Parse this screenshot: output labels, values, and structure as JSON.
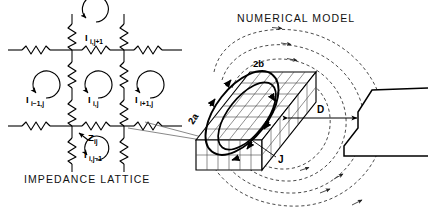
{
  "figure": {
    "background_color": "#ffffff",
    "ink_color": "#000000",
    "dash_color": "#333333",
    "panels": [
      {
        "id": "impedance-lattice",
        "caption": "IMPEDANCE LATTICE"
      },
      {
        "id": "numerical-model",
        "caption": "NUMERICAL MODEL"
      }
    ]
  },
  "lattice": {
    "caption": "IMPEDANCE LATTICE",
    "impedance_label": "Z",
    "impedance_sub": "ij",
    "loops": [
      {
        "name": "loop-up",
        "base": "I",
        "sub": "i,j+1",
        "direction": "clockwise"
      },
      {
        "name": "loop-left",
        "base": "I",
        "sub": "i−1,j",
        "direction": "clockwise"
      },
      {
        "name": "loop-center",
        "base": "I",
        "sub": "i,j",
        "direction": "clockwise"
      },
      {
        "name": "loop-right",
        "base": "I",
        "sub": "i+1,j",
        "direction": "clockwise"
      },
      {
        "name": "loop-down",
        "base": "I",
        "sub": "i,j−1",
        "direction": "clockwise"
      }
    ],
    "element_type": "resistor-zigzag",
    "grid_columns": 2,
    "grid_rows": 3
  },
  "model": {
    "caption": "NUMERICAL MODEL",
    "labels": {
      "major_axis": "2a",
      "minor_axis": "2b",
      "standoff": "D",
      "current_density": "J"
    },
    "mesh": {
      "name": "conductor-block",
      "columns": 8,
      "rows": 5,
      "type": "3d-parallelepiped"
    },
    "coil_loops": 2,
    "flux_arcs": 4,
    "target": {
      "name": "rail-profile",
      "type": "flanged-rail-cross-section"
    }
  }
}
